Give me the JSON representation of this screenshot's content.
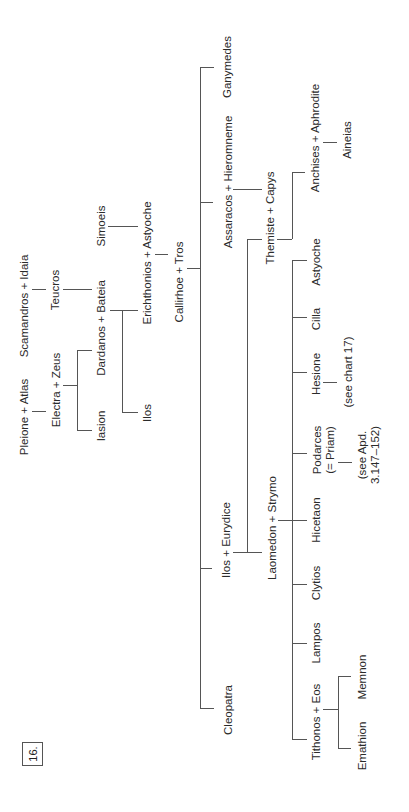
{
  "chart_number": "16.",
  "nodes": {
    "pleione_atlas": "Pleione + Atlas",
    "scamandros_idaia": "Scamandros + Idaia",
    "electra_zeus": "Electra + Zeus",
    "teucros": "Teucros",
    "iasion": "Iasion",
    "dardanos_bateia": "Dardanos + Bateia",
    "simoeis": "Simoeis",
    "ilos_1": "Ilos",
    "erichthonios_astyoche": "Erichthonios + Astyoche",
    "callirhoe_tros": "Callirhoe + Tros",
    "cleopatra": "Cleopatra",
    "ilos_eurydice": "Ilos + Eurydice",
    "assaracos_hieromneme": "Assaracos + Hieromneme",
    "ganymedes": "Ganymedes",
    "laomedon_strymo": "Laomedon + Strymo",
    "themiste_capys": "Themiste + Capys",
    "anchises_aphrodite": "Anchises + Aphrodite",
    "aineias": "Aineias",
    "tithonos_eos": "Tithonos + Eos",
    "lampos": "Lampos",
    "clytios": "Clytios",
    "hicetaon": "Hicetaon",
    "podarces": "Podarces",
    "podarces_alias": "(= Priam)",
    "hesione": "Hesione",
    "cilla": "Cilla",
    "astyoche": "Astyoche",
    "memnon": "Memnon",
    "emathion": "Emathion",
    "hesione_note": "(see chart 17)",
    "podarces_note_1": "(see Apd.",
    "podarces_note_2": "3.147–152)"
  },
  "colors": {
    "line": "#555555",
    "text": "#2a2a2a",
    "background": "#ffffff"
  },
  "orientation": "rotated 90° counter-clockwise"
}
